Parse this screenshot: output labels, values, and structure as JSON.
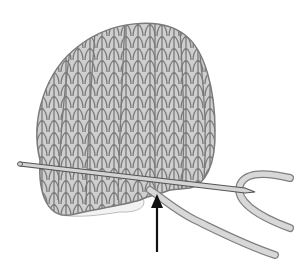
{
  "illustration": {
    "subject": "knitted hat on needle with yarn",
    "colors": {
      "background": "#ffffff",
      "knit_fill": "#cfcfcf",
      "knit_outline": "#7a7a7a",
      "lining_fill": "#f2f2f2",
      "needle_fill": "#d4d4d4",
      "needle_outline": "#555555",
      "yarn_fill": "#d8d8d8",
      "yarn_outline": "#808080",
      "arrow": "#111111"
    },
    "arrow": {
      "direction": "up",
      "x": 157,
      "y_tip": 195,
      "y_tail": 252
    }
  }
}
